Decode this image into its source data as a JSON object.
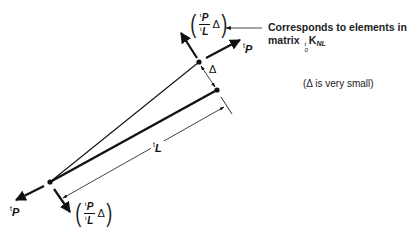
{
  "diagram": {
    "labels": {
      "force_top": {
        "sup": "t",
        "var": "P"
      },
      "force_bottom": {
        "sup": "t",
        "var": "P"
      },
      "length": {
        "sup": "t",
        "var": "L"
      },
      "displacement": "Δ",
      "transverse_force_top": {
        "num_sup": "t",
        "num": "P",
        "den_sup": "t",
        "den": "L",
        "factor": "Δ"
      },
      "transverse_force_bottom": {
        "num_sup": "t",
        "num": "P",
        "den_sup": "t",
        "den": "L",
        "factor": "Δ"
      }
    },
    "annotation": {
      "line1": "Corresponds to elements in",
      "line2_prefix": "matrix ",
      "matrix_symbol": "K",
      "matrix_presup": "t",
      "matrix_presub": "0",
      "matrix_subscript": "NL"
    },
    "note": "(Δ is very small)",
    "nodes": {
      "left": [
        50,
        182
      ],
      "top_rotated": [
        199,
        62
      ],
      "right_original": [
        217,
        90
      ]
    },
    "colors": {
      "stroke": "#111111",
      "background": "#ffffff"
    }
  }
}
